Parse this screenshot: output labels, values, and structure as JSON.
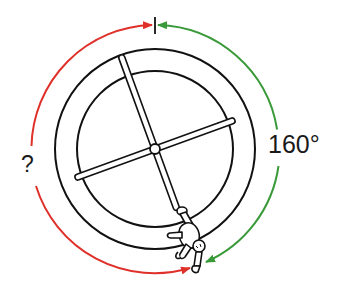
{
  "diagram": {
    "labels": {
      "known_angle": "160°",
      "unknown_angle": "?"
    },
    "colors": {
      "known_arc": "#3a9a3a",
      "unknown_arc": "#e0302a",
      "stroke": "#111111",
      "background": "#ffffff"
    },
    "geometry": {
      "center": [
        155,
        149
      ],
      "outer_ring_radius": 100,
      "inner_ring_radius": 78,
      "arrow_arc_radius": 124,
      "hub_radius": 5,
      "reference_mark_angle_deg": 0,
      "person_position_angle_deg": 160
    }
  }
}
